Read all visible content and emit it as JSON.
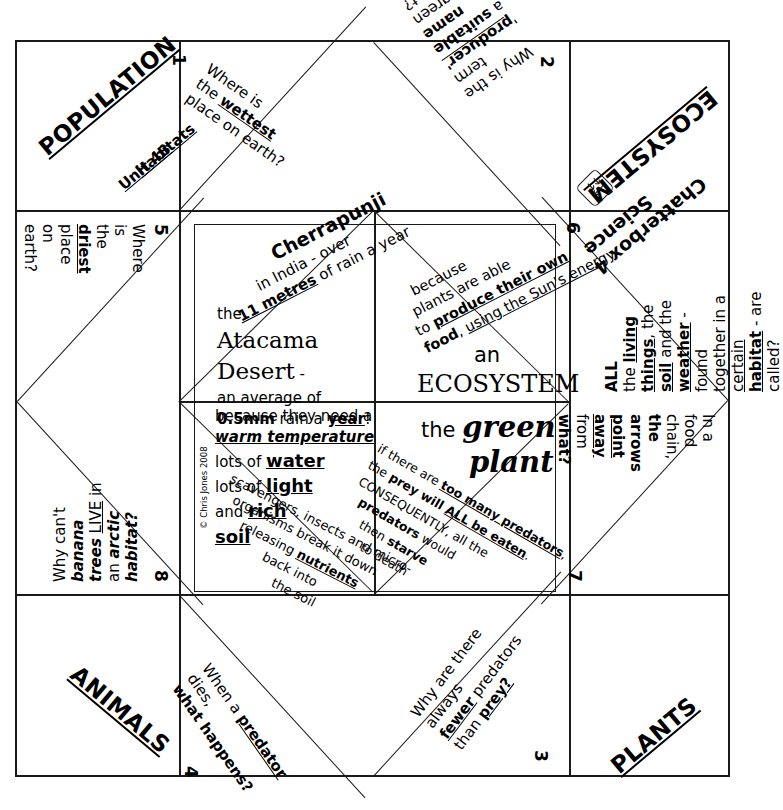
{
  "document": {
    "title": "Science Chatterbox 4",
    "subject_labels": [
      "POPULATION",
      "ECOSYSTEM",
      "ANIMALS",
      "PLANTS"
    ],
    "unit_label_line1": "Unit 4B",
    "unit_label_line2": "Habitats",
    "copyright": "© Chris Jones 2008",
    "logo_name": "fold-arrows-logo"
  },
  "corners": {
    "top_left": {
      "label": "POPULATION",
      "sub1": "Unit 4B",
      "sub2": "Habitats"
    },
    "top_right": {
      "label": "ECOSYSTEM",
      "title": "Chatterbox 4",
      "title2": "Science"
    },
    "bottom_left": {
      "label": "ANIMALS"
    },
    "bottom_right": {
      "label": "PLANTS"
    }
  },
  "questions": [
    {
      "number": "1",
      "position": "top-left-flap",
      "lines": [
        [
          {
            "t": "Where is",
            "s": "n"
          }
        ],
        [
          {
            "t": "the ",
            "s": "n"
          },
          {
            "t": "wettest",
            "s": "bu"
          }
        ],
        [
          {
            "t": "place on earth?",
            "s": "n"
          }
        ]
      ]
    },
    {
      "number": "2",
      "position": "top-right-flap",
      "lines": [
        [
          {
            "t": "Why is the",
            "s": "n"
          }
        ],
        [
          {
            "t": "term '",
            "s": "n"
          },
          {
            "t": "producer'",
            "s": "bu"
          }
        ],
        [
          {
            "t": "a ",
            "s": "n"
          },
          {
            "t": "suitable name",
            "s": "b"
          }
        ],
        [
          {
            "t": "for a green plant?",
            "s": "n"
          }
        ]
      ]
    },
    {
      "number": "3",
      "position": "bottom-right-flap",
      "lines": [
        [
          {
            "t": "Why are there always",
            "s": "n"
          }
        ],
        [
          {
            "t": "fewer",
            "s": "bu"
          },
          {
            "t": " predators",
            "s": "n"
          }
        ],
        [
          {
            "t": "than ",
            "s": "n"
          },
          {
            "t": "prey?",
            "s": "bu"
          }
        ]
      ]
    },
    {
      "number": "4",
      "position": "bottom-left-flap",
      "lines": [
        [
          {
            "t": "When a ",
            "s": "n"
          },
          {
            "t": "predator",
            "s": "bu"
          },
          {
            "t": " dies,",
            "s": "n"
          }
        ],
        [
          {
            "t": "what happens?",
            "s": "b"
          }
        ]
      ]
    },
    {
      "number": "5",
      "position": "left-upper-triangle",
      "lines": [
        [
          {
            "t": "Where is",
            "s": "n"
          }
        ],
        [
          {
            "t": "the ",
            "s": "n"
          },
          {
            "t": "driest",
            "s": "bu"
          }
        ],
        [
          {
            "t": "place on earth?",
            "s": "n"
          }
        ]
      ]
    },
    {
      "number": "6",
      "position": "right-upper-triangle",
      "lines": [
        [
          {
            "t": "ALL",
            "s": "b"
          }
        ],
        [
          {
            "t": "the ",
            "s": "n"
          },
          {
            "t": "living",
            "s": "bu"
          }
        ],
        [
          {
            "t": "things",
            "s": "bu"
          },
          {
            "t": ", the",
            "s": "n"
          }
        ],
        [
          {
            "t": "soil",
            "s": "bu"
          },
          {
            "t": " and the",
            "s": "n"
          }
        ],
        [
          {
            "t": "weather",
            "s": "bu"
          },
          {
            "t": " - found",
            "s": "n"
          }
        ],
        [
          {
            "t": "together in a ",
            "s": "n"
          },
          {
            "t": "certain",
            "s": "u"
          }
        ],
        [
          {
            "t": "habitat",
            "s": "bu"
          },
          {
            "t": " - are called?",
            "s": "n"
          }
        ]
      ]
    },
    {
      "number": "7",
      "position": "right-lower-triangle",
      "lines": [
        [
          {
            "t": "In a food chain,",
            "s": "n"
          }
        ],
        [
          {
            "t": "the arrows",
            "s": "b"
          }
        ],
        [
          {
            "t": "point away",
            "s": "bu"
          }
        ],
        [
          {
            "t": "from",
            "s": "n"
          }
        ],
        [
          {
            "t": "what?",
            "s": "b"
          }
        ]
      ]
    },
    {
      "number": "8",
      "position": "left-lower-triangle",
      "lines": [
        [
          {
            "t": "Why can't ",
            "s": "n"
          },
          {
            "t": "banana",
            "s": "bi"
          }
        ],
        [
          {
            "t": "trees",
            "s": "bi"
          },
          {
            "t": " ",
            "s": "n"
          },
          {
            "t": "LIVE",
            "s": "u"
          },
          {
            "t": " in",
            "s": "n"
          }
        ],
        [
          {
            "t": "an ",
            "s": "n"
          },
          {
            "t": "arctic",
            "s": "bi"
          }
        ],
        [
          {
            "t": "habitat?",
            "s": "bi"
          }
        ]
      ]
    }
  ],
  "answers": [
    {
      "id": "answer-wettest",
      "cell": "inner-top-left-diagonal",
      "lines": [
        [
          {
            "t": "Cherrapunji",
            "s": "b"
          }
        ],
        [
          {
            "t": "in  India - over",
            "s": "n"
          }
        ],
        [
          {
            "t": "11 metres",
            "s": "bu"
          },
          {
            "t": " of rain a year",
            "s": "n"
          }
        ]
      ]
    },
    {
      "id": "answer-driest",
      "cell": "inner-top-left-lower",
      "lines": [
        [
          {
            "t": "the",
            "s": "n"
          }
        ],
        [
          {
            "t": "Atacama",
            "s": "serif"
          }
        ],
        [
          {
            "t": "Desert",
            "s": "serif"
          },
          {
            "t": " -",
            "s": "n"
          }
        ],
        [
          {
            "t": "an average of",
            "s": "n"
          }
        ],
        [
          {
            "t": "0.5mm",
            "s": "b"
          },
          {
            "t": " rain a ",
            "s": "n"
          },
          {
            "t": "year",
            "s": "bu"
          },
          {
            "t": "!",
            "s": "n"
          }
        ]
      ]
    },
    {
      "id": "answer-producer",
      "cell": "inner-top-right-diagonal",
      "lines": [
        [
          {
            "t": "because",
            "s": "n"
          }
        ],
        [
          {
            "t": "plants are able",
            "s": "n"
          }
        ],
        [
          {
            "t": "to ",
            "s": "n"
          },
          {
            "t": "produce their own",
            "s": "b"
          }
        ],
        [
          {
            "t": "food",
            "s": "b"
          },
          {
            "t": ", ",
            "s": "n"
          },
          {
            "t": "using the Sun's energy",
            "s": "u"
          }
        ]
      ]
    },
    {
      "id": "answer-ecosystem",
      "cell": "inner-top-right-lower",
      "lines": [
        [
          {
            "t": "an",
            "s": "n"
          }
        ],
        [
          {
            "t": "ECOSYSTEM",
            "s": "serif"
          }
        ]
      ]
    },
    {
      "id": "answer-banana",
      "cell": "inner-bottom-left-upper",
      "lines": [
        [
          {
            "t": "because they need a",
            "s": "n"
          }
        ],
        [
          {
            "t": "warm temperature",
            "s": "bui"
          }
        ],
        [
          {
            "t": "lots of ",
            "s": "n"
          },
          {
            "t": "water",
            "s": "bu"
          }
        ],
        [
          {
            "t": "lots of ",
            "s": "n"
          },
          {
            "t": "light",
            "s": "bu"
          }
        ],
        [
          {
            "t": "and ",
            "s": "n"
          },
          {
            "t": "rich",
            "s": "bu"
          }
        ],
        [
          {
            "t": "soil",
            "s": "bu"
          }
        ]
      ]
    },
    {
      "id": "answer-predator-dies",
      "cell": "inner-bottom-left-diagonal",
      "lines": [
        [
          {
            "t": "scavengers, insects and micro-",
            "s": "n"
          }
        ],
        [
          {
            "t": "organisms break it down",
            "s": "n"
          }
        ],
        [
          {
            "t": "releasing ",
            "s": "n"
          },
          {
            "t": "nutrients",
            "s": "bu"
          }
        ],
        [
          {
            "t": "back into",
            "s": "n"
          }
        ],
        [
          {
            "t": "the soil",
            "s": "n"
          }
        ]
      ]
    },
    {
      "id": "answer-green-plant",
      "cell": "inner-bottom-right-upper",
      "lines": [
        [
          {
            "t": "the ",
            "s": "n"
          },
          {
            "t": "green",
            "s": "serifbi"
          }
        ],
        [
          {
            "t": "plant",
            "s": "serifbi"
          }
        ]
      ]
    },
    {
      "id": "answer-fewer-predators",
      "cell": "inner-bottom-right-diagonal",
      "lines": [
        [
          {
            "t": "if there are ",
            "s": "n"
          },
          {
            "t": "too many predators",
            "s": "bu"
          },
          {
            "t": ",",
            "s": "n"
          }
        ],
        [
          {
            "t": "the ",
            "s": "n"
          },
          {
            "t": "prey will ",
            "s": "b"
          },
          {
            "t": "ALL be eaten",
            "s": "bu"
          },
          {
            "t": ".",
            "s": "n"
          }
        ],
        [
          {
            "t": "CONSEQUENTLY, all the",
            "s": "n"
          }
        ],
        [
          {
            "t": "predators",
            "s": "b"
          },
          {
            "t": " would",
            "s": "n"
          }
        ],
        [
          {
            "t": "then ",
            "s": "n"
          },
          {
            "t": "starve",
            "s": "b"
          }
        ],
        [
          {
            "t": "to death",
            "s": "n"
          }
        ]
      ]
    }
  ]
}
